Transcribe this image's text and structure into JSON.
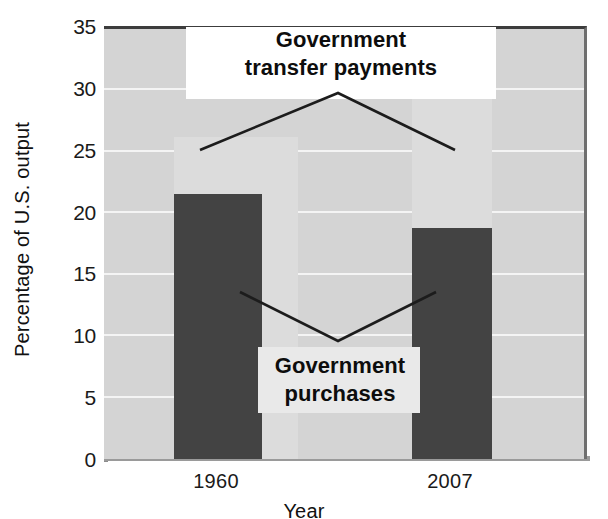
{
  "chart_data": {
    "type": "bar",
    "title": "",
    "subtitle": "",
    "xlabel": "Year",
    "ylabel": "Percentage of U.S. output",
    "categories": [
      "1960",
      "2007"
    ],
    "ylim": [
      0,
      35
    ],
    "yticks": [
      0,
      5,
      10,
      15,
      20,
      25,
      30,
      35
    ],
    "ytick_labels": [
      "0",
      "5",
      "10",
      "15",
      "20",
      "25",
      "30",
      "35"
    ],
    "grid": true,
    "legend_position": "inline-annotations",
    "series": [
      {
        "name": "Government transfer payments",
        "color": "#dcdcdc",
        "values": [
          26.2,
          31.0
        ]
      },
      {
        "name": "Government purchases",
        "color": "#434343",
        "values": [
          21.6,
          18.8
        ]
      }
    ],
    "annotations": [
      {
        "name": "transfer-payments-callout",
        "line1": "Government",
        "line2": "transfer payments",
        "text": "Government transfer payments",
        "points_to": [
          "1960",
          "2007"
        ]
      },
      {
        "name": "purchases-callout",
        "line1": "Government",
        "line2": "purchases",
        "text": "Government purchases",
        "points_to": [
          "1960",
          "2007"
        ]
      }
    ],
    "colors": {
      "plot_background": "#d4d4d4",
      "gridline": "#f4f4f4",
      "transfer_bar": "#dcdcdc",
      "purchases_bar": "#434343",
      "text": "#111111"
    }
  }
}
